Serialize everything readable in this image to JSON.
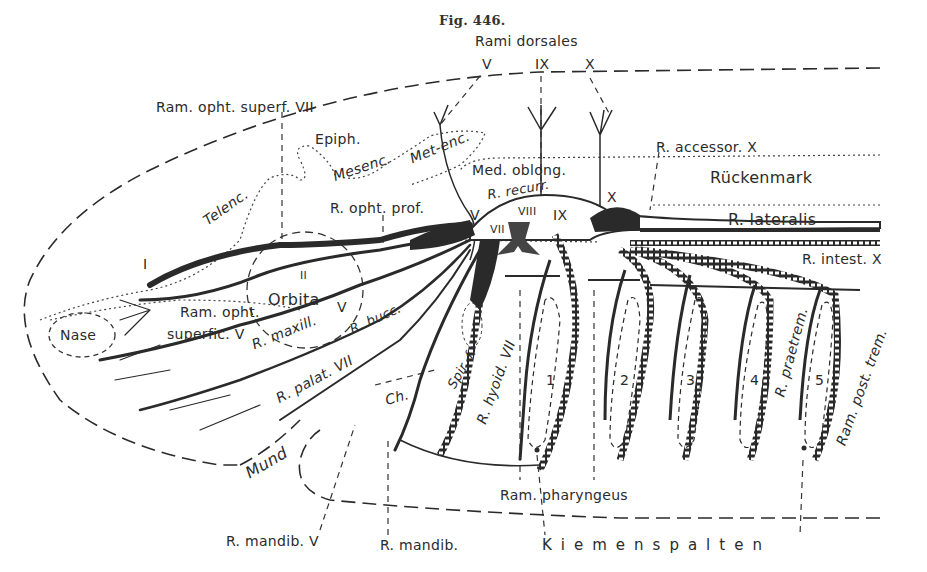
{
  "figure": {
    "caption": "Fig. 446.",
    "colors": {
      "ink": "#2a2a2a",
      "fill": "#333333",
      "paper": "#ffffff"
    }
  },
  "labels": {
    "rami_dorsales": "Rami dorsales",
    "rd_V": "V",
    "rd_IX": "IX",
    "rd_X": "X",
    "ram_opht_superf_VII": "Ram. opht. superf. VII",
    "epiph": "Epiph.",
    "mesenc": "Mesenc.",
    "metenc": "Met-enc.",
    "telenc": "Telenc.",
    "med_oblong": "Med. oblong.",
    "r_recurr": "R. recurr.",
    "r_accessor_X": "R. accessor. X",
    "rueckenmark": "Rückenmark",
    "r_opht_prof": "R. opht. prof.",
    "r_lateralis": "R. lateralis",
    "r_intest_X": "R. intest. X",
    "nerve_I": "I",
    "nerve_II": "II",
    "nerve_V": "V",
    "nerve_VII": "VII",
    "nerve_VIII": "VIII",
    "nerve_IX": "IX",
    "nerve_X": "X",
    "orbita": "Orbita",
    "orbita_V": "V",
    "nase": "Nase",
    "ram_opht_superfic_V_1": "Ram. opht.",
    "ram_opht_superfic_V_2": "superfic. V",
    "r_maxill": "R. maxill.",
    "r_bucc": "R. bucc.",
    "r_palat_VII": "R. palat. VII",
    "ch": "Ch.",
    "spir": "Spir. f.",
    "r_hyoid_VII": "R. hyoid. VII",
    "gill_1": "1",
    "gill_2": "2",
    "gill_3": "3",
    "gill_4": "4",
    "gill_5": "5",
    "r_praetrem": "R. praetrem.",
    "ram_post_trem": "Ram. post. trem.",
    "mund": "Mund",
    "ram_pharyngeus": "Ram. pharyngeus",
    "r_mandib_V": "R. mandib. V",
    "r_mandib": "R. mandib.",
    "kiemenspalten": "Kiemenspalten"
  }
}
